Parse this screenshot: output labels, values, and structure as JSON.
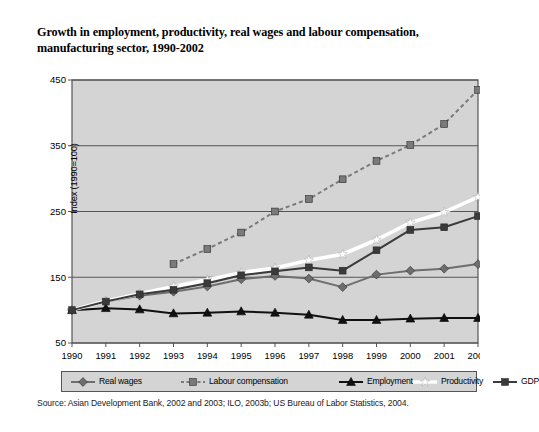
{
  "figure": {
    "title": "Growth in employment, productivity, real wages and labour compensation, manufacturing sector, 1990-2002",
    "source": "Source: Asian Development Bank, 2002 and 2003; ILO, 2003b; US Bureau of Labor Statistics, 2004.",
    "plot_bg": "#d4d4d4",
    "page_bg": "#ffffff",
    "frame_color": "#555555"
  },
  "chart_data": {
    "type": "line",
    "title": "Growth in employment, productivity, real wages and labour compensation, manufacturing sector, 1990-2002",
    "xlabel": "",
    "ylabel": "Index (1990=100)",
    "x": [
      1990,
      1991,
      1992,
      1993,
      1994,
      1995,
      1996,
      1997,
      1998,
      1999,
      2000,
      2001,
      2002
    ],
    "xticklabels": [
      "1990",
      "1991",
      "1992",
      "1993",
      "1994",
      "1995",
      "1996",
      "1997",
      "1998",
      "1999",
      "2000",
      "2001",
      "2002"
    ],
    "yticks": [
      50,
      150,
      250,
      350,
      450
    ],
    "yticklabels": [
      "50",
      "150",
      "250",
      "350",
      "450"
    ],
    "ylim": [
      50,
      450
    ],
    "grid": true,
    "legend_position": "bottom",
    "series": [
      {
        "name": "Real wages",
        "color": "#6e6e6e",
        "marker": "diamond",
        "linestyle": "solid",
        "values": [
          100,
          113,
          122,
          128,
          136,
          147,
          152,
          148,
          135,
          154,
          160,
          163,
          170
        ]
      },
      {
        "name": "Labour compensation",
        "color": "#7a7a7a",
        "marker": "square",
        "linestyle": "dashed",
        "values": [
          null,
          null,
          null,
          170,
          193,
          218,
          250,
          269,
          299,
          327,
          351,
          383,
          435
        ]
      },
      {
        "name": "Employment",
        "color": "#111111",
        "marker": "triangle",
        "linestyle": "solid",
        "values": [
          100,
          103,
          101,
          95,
          96,
          98,
          96,
          93,
          85,
          85,
          87,
          88,
          88
        ]
      },
      {
        "name": "Productivity",
        "color": "#ffffff",
        "marker": "star",
        "linestyle": "solid",
        "values": [
          100,
          114,
          125,
          136,
          146,
          157,
          164,
          176,
          185,
          207,
          233,
          249,
          272
        ]
      },
      {
        "name": "GDP",
        "color": "#3a3a3a",
        "marker": "square",
        "linestyle": "solid",
        "values": [
          100,
          113,
          124,
          131,
          141,
          153,
          159,
          165,
          160,
          191,
          222,
          226,
          243
        ]
      }
    ]
  },
  "legend": {
    "items": [
      {
        "label": "Real wages",
        "marker": "diamond-icon",
        "color": "#6e6e6e",
        "dashed": false
      },
      {
        "label": "Labour compensation",
        "marker": "square-icon",
        "color": "#7a7a7a",
        "dashed": true
      },
      {
        "label": "Employment",
        "marker": "triangle-icon",
        "color": "#111111",
        "dashed": false
      },
      {
        "label": "Productivity",
        "marker": "star-icon",
        "color": "#ffffff",
        "dashed": false
      },
      {
        "label": "GDP",
        "marker": "square-icon",
        "color": "#3a3a3a",
        "dashed": false
      }
    ]
  }
}
